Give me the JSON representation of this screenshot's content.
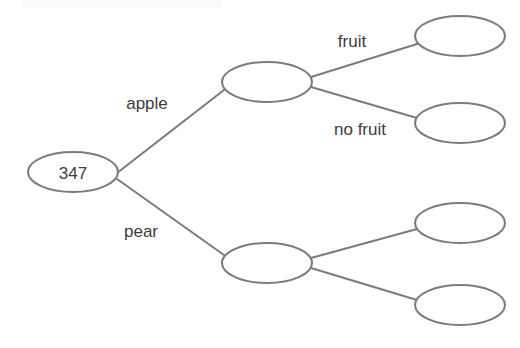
{
  "diagram": {
    "type": "tree",
    "background_color": "#ffffff",
    "stroke_color": "#7c7c7c",
    "text_color": "#3c3c3c",
    "node_fill": "#ffffff"
  },
  "nodes": [
    {
      "id": "root",
      "label": "347",
      "cx": 73,
      "cy": 172,
      "rx": 45,
      "ry": 20
    },
    {
      "id": "apple",
      "label": "",
      "cx": 267,
      "cy": 82,
      "rx": 45,
      "ry": 20
    },
    {
      "id": "pear",
      "label": "",
      "cx": 267,
      "cy": 263,
      "rx": 45,
      "ry": 20
    },
    {
      "id": "apple-fruit",
      "label": "",
      "cx": 460,
      "cy": 36,
      "rx": 45,
      "ry": 20
    },
    {
      "id": "apple-no-fruit",
      "label": "",
      "cx": 460,
      "cy": 123,
      "rx": 45,
      "ry": 20
    },
    {
      "id": "pear-fruit",
      "label": "",
      "cx": 460,
      "cy": 223,
      "rx": 45,
      "ry": 20
    },
    {
      "id": "pear-no-fruit",
      "label": "",
      "cx": 460,
      "cy": 305,
      "rx": 45,
      "ry": 20
    }
  ],
  "edges": [
    {
      "id": "root-apple",
      "from": "root",
      "to": "apple",
      "label": "apple",
      "label_x": 147,
      "label_y": 103,
      "x1": 117,
      "y1": 173,
      "x2": 224,
      "y2": 90
    },
    {
      "id": "root-pear",
      "from": "root",
      "to": "pear",
      "label": "pear",
      "label_x": 141,
      "label_y": 231,
      "x1": 117,
      "y1": 179,
      "x2": 224,
      "y2": 255
    },
    {
      "id": "apple-to-fruit",
      "from": "apple",
      "to": "apple-fruit",
      "label": "fruit",
      "label_x": 352,
      "label_y": 41,
      "x1": 311,
      "y1": 77,
      "x2": 417,
      "y2": 44
    },
    {
      "id": "apple-to-no-fruit",
      "from": "apple",
      "to": "apple-no-fruit",
      "label": "no fruit",
      "label_x": 360,
      "label_y": 129,
      "x1": 311,
      "y1": 87,
      "x2": 417,
      "y2": 118
    },
    {
      "id": "pear-to-fruit",
      "from": "pear",
      "to": "pear-fruit",
      "label": "",
      "label_x": 0,
      "label_y": 0,
      "x1": 311,
      "y1": 258,
      "x2": 417,
      "y2": 229
    },
    {
      "id": "pear-to-no-fruit",
      "from": "pear",
      "to": "pear-no-fruit",
      "label": "",
      "label_x": 0,
      "label_y": 0,
      "x1": 311,
      "y1": 268,
      "x2": 417,
      "y2": 300
    }
  ],
  "labels": {
    "root_value": "347",
    "branch_apple": "apple",
    "branch_pear": "pear",
    "branch_fruit": "fruit",
    "branch_no_fruit": "no fruit"
  }
}
